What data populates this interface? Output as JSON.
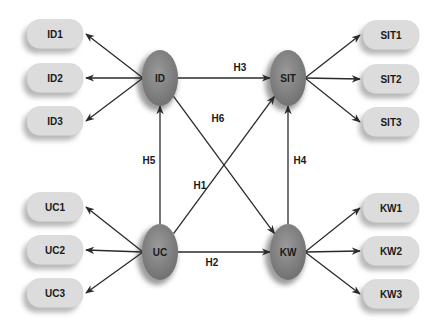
{
  "colors": {
    "construct_fill": "#8a8a8a",
    "construct_dark": "#6e6e6e",
    "indicator_fill": "#dcdcdc",
    "indicator_shadow": "#b8b8b8",
    "edge": "#2a2a2a",
    "text": "#1a1a1a"
  },
  "constructs": [
    {
      "id": "ID",
      "label": "ID",
      "cx": 160,
      "cy": 78
    },
    {
      "id": "SIT",
      "label": "SIT",
      "cx": 288,
      "cy": 78
    },
    {
      "id": "UC",
      "label": "UC",
      "cx": 160,
      "cy": 252
    },
    {
      "id": "KW",
      "label": "KW",
      "cx": 288,
      "cy": 252
    }
  ],
  "indicators": [
    {
      "label": "ID1",
      "side": "left",
      "cy": 34,
      "parent": "ID"
    },
    {
      "label": "ID2",
      "side": "left",
      "cy": 78,
      "parent": "ID"
    },
    {
      "label": "ID3",
      "side": "left",
      "cy": 121,
      "parent": "ID"
    },
    {
      "label": "UC1",
      "side": "left",
      "cy": 207,
      "parent": "UC"
    },
    {
      "label": "UC2",
      "side": "left",
      "cy": 250,
      "parent": "UC"
    },
    {
      "label": "UC3",
      "side": "left",
      "cy": 293,
      "parent": "UC"
    },
    {
      "label": "SIT1",
      "side": "right",
      "cy": 35,
      "parent": "SIT"
    },
    {
      "label": "SIT2",
      "side": "right",
      "cy": 79,
      "parent": "SIT"
    },
    {
      "label": "SIT3",
      "side": "right",
      "cy": 122,
      "parent": "SIT"
    },
    {
      "label": "KW1",
      "side": "right",
      "cy": 208,
      "parent": "KW"
    },
    {
      "label": "KW2",
      "side": "right",
      "cy": 251,
      "parent": "KW"
    },
    {
      "label": "KW3",
      "side": "right",
      "cy": 294,
      "parent": "KW"
    }
  ],
  "hypotheses": [
    {
      "label": "H1",
      "from": "UC",
      "to": "SIT",
      "lx": 200,
      "ly": 189
    },
    {
      "label": "H2",
      "from": "UC",
      "to": "KW",
      "lx": 212,
      "ly": 266
    },
    {
      "label": "H3",
      "from": "ID",
      "to": "SIT",
      "lx": 240,
      "ly": 71
    },
    {
      "label": "H4",
      "from": "KW",
      "to": "SIT",
      "lx": 300,
      "ly": 164
    },
    {
      "label": "H5",
      "from": "UC",
      "to": "ID",
      "lx": 149,
      "ly": 164
    },
    {
      "label": "H6",
      "from": "ID",
      "to": "KW",
      "lx": 218,
      "ly": 122
    }
  ]
}
